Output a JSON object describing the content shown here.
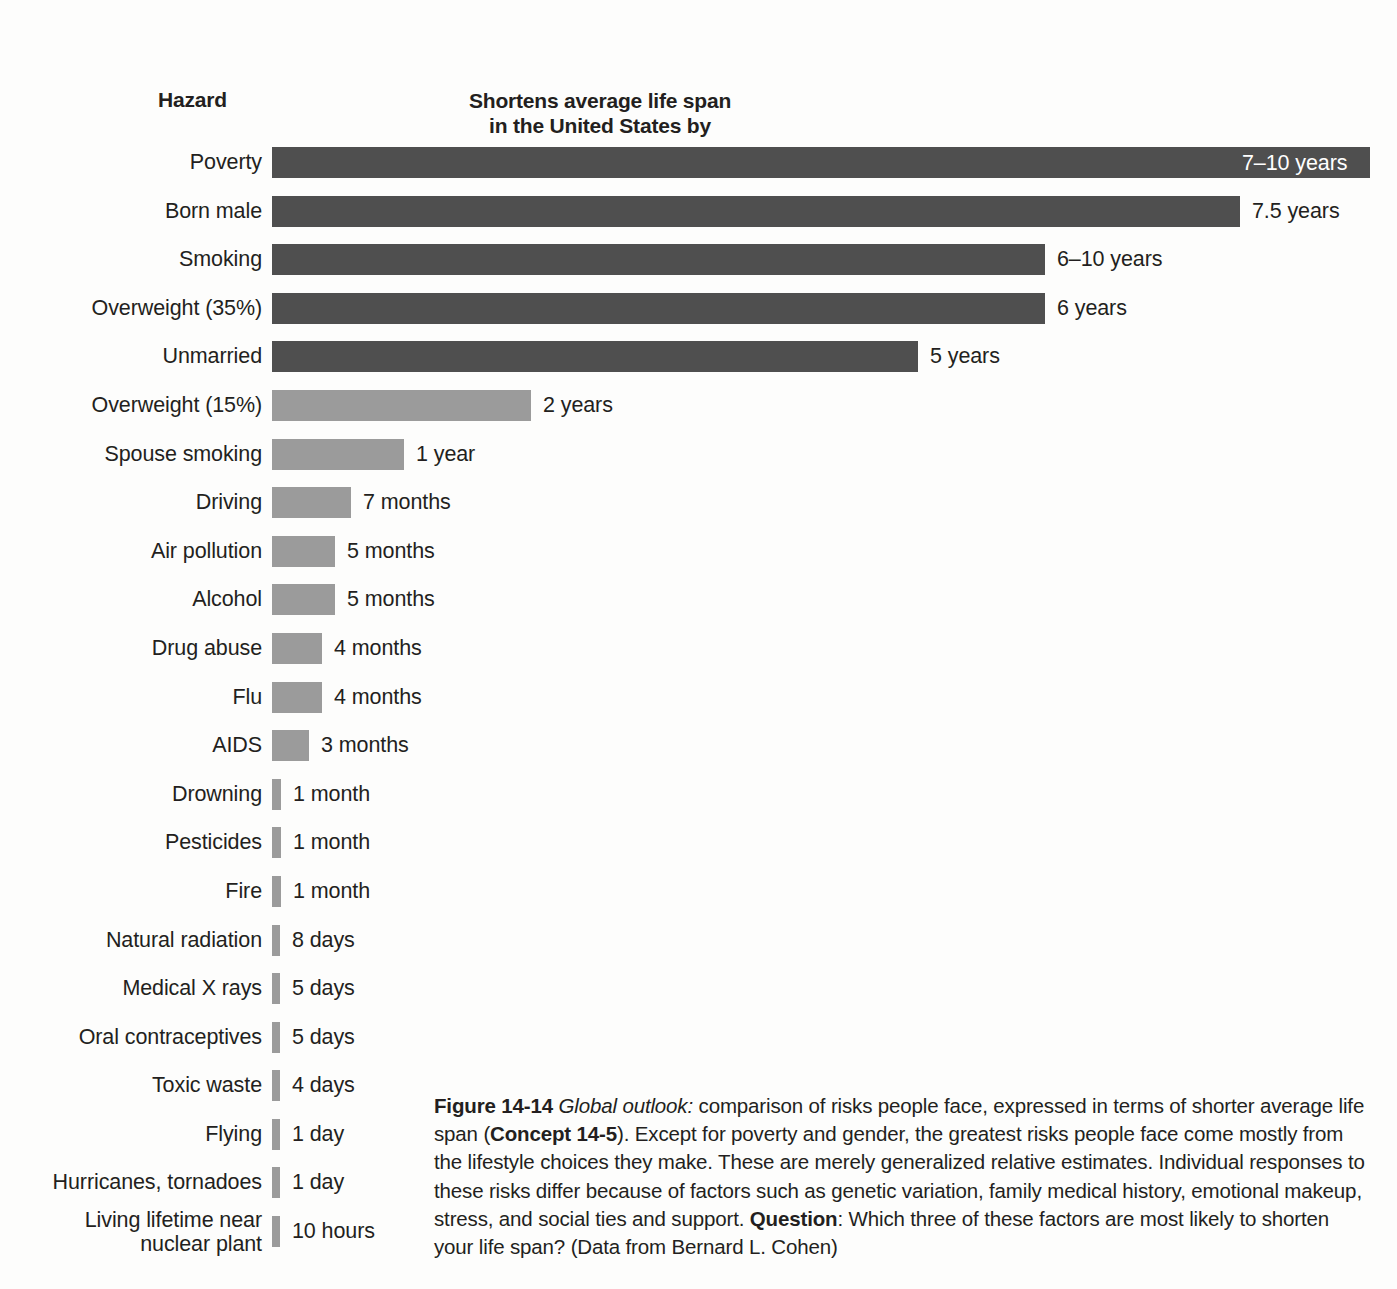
{
  "header": {
    "hazard_label": "Hazard",
    "value_label": "Shortens average life span\nin the United States by",
    "value_label_line1": "Shortens average life span",
    "value_label_line2": "in the United States by"
  },
  "colors": {
    "bar_dark": "#4f4f4f",
    "bar_light": "#9b9b9b",
    "text": "#231f20",
    "background": "#fdfdfc",
    "inside_label_text": "#ffffff"
  },
  "caption": {
    "figure_number": "Figure 14-14",
    "lead_italic": "Global outlook:",
    "text_part1": " comparison of risks people face, expressed in terms of shorter average life span (",
    "concept": "Concept 14-5",
    "text_part2": "). Except for poverty and gender, the greatest risks people face come mostly from the lifestyle choices they make. These are merely generalized relative estimates. Individual responses to these risks differ because of factors such as genetic variation, family medical history, emotional makeup, stress, and social ties and support. ",
    "question_label": "Question",
    "text_part3": ": Which three of these factors are most likely to shorten your life span? (Data from Bernard L. Cohen)"
  },
  "chart_data": {
    "type": "bar",
    "orientation": "horizontal",
    "title": "Shortens average life span in the United States by",
    "xlabel": "",
    "ylabel": "Hazard",
    "grid": false,
    "legend": "none",
    "axis_labels_shown": false,
    "categories": [
      "Poverty",
      "Born male",
      "Smoking",
      "Overweight (35%)",
      "Unmarried",
      "Overweight (15%)",
      "Spouse smoking",
      "Driving",
      "Air pollution",
      "Alcohol",
      "Drug abuse",
      "Flu",
      "AIDS",
      "Drowning",
      "Pesticides",
      "Fire",
      "Natural radiation",
      "Medical X rays",
      "Oral contraceptives",
      "Toxic waste",
      "Flying",
      "Hurricanes, tornadoes",
      "Living lifetime near nuclear plant"
    ],
    "value_labels": [
      "7–10 years",
      "7.5 years",
      "6–10 years",
      "6 years",
      "5 years",
      "2 years",
      "1 year",
      "7 months",
      "5 months",
      "5 months",
      "4 months",
      "4 months",
      "3 months",
      "1 month",
      "1 month",
      "1 month",
      "8 days",
      "5 days",
      "5 days",
      "4 days",
      "1 day",
      "1 day",
      "10 hours"
    ],
    "values_years": [
      8.5,
      7.5,
      8.0,
      6.0,
      5.0,
      2.0,
      1.0,
      0.583,
      0.417,
      0.417,
      0.333,
      0.333,
      0.25,
      0.083,
      0.083,
      0.083,
      0.0219,
      0.0137,
      0.0137,
      0.011,
      0.0027,
      0.0027,
      0.00114
    ],
    "rows": [
      {
        "hazard": "Poverty",
        "label": "7–10 years",
        "bar_px": 1098,
        "shade": "dark",
        "label_inside": true,
        "lines": 1
      },
      {
        "hazard": "Born male",
        "label": "7.5 years",
        "bar_px": 968,
        "shade": "dark",
        "label_inside": false,
        "lines": 1
      },
      {
        "hazard": "Smoking",
        "label": "6–10 years",
        "bar_px": 773,
        "shade": "dark",
        "label_inside": false,
        "lines": 1
      },
      {
        "hazard": "Overweight (35%)",
        "label": "6 years",
        "bar_px": 773,
        "shade": "dark",
        "label_inside": false,
        "lines": 1
      },
      {
        "hazard": "Unmarried",
        "label": "5 years",
        "bar_px": 646,
        "shade": "dark",
        "label_inside": false,
        "lines": 1
      },
      {
        "hazard": "Overweight (15%)",
        "label": "2 years",
        "bar_px": 259,
        "shade": "light",
        "label_inside": false,
        "lines": 1
      },
      {
        "hazard": "Spouse smoking",
        "label": "1 year",
        "bar_px": 132,
        "shade": "light",
        "label_inside": false,
        "lines": 1
      },
      {
        "hazard": "Driving",
        "label": "7 months",
        "bar_px": 79,
        "shade": "light",
        "label_inside": false,
        "lines": 1
      },
      {
        "hazard": "Air pollution",
        "label": "5 months",
        "bar_px": 63,
        "shade": "light",
        "label_inside": false,
        "lines": 1
      },
      {
        "hazard": "Alcohol",
        "label": "5 months",
        "bar_px": 63,
        "shade": "light",
        "label_inside": false,
        "lines": 1
      },
      {
        "hazard": "Drug abuse",
        "label": "4 months",
        "bar_px": 50,
        "shade": "light",
        "label_inside": false,
        "lines": 1
      },
      {
        "hazard": "Flu",
        "label": "4 months",
        "bar_px": 50,
        "shade": "light",
        "label_inside": false,
        "lines": 1
      },
      {
        "hazard": "AIDS",
        "label": "3 months",
        "bar_px": 37,
        "shade": "light",
        "label_inside": false,
        "lines": 1
      },
      {
        "hazard": "Drowning",
        "label": "1 month",
        "bar_px": 9,
        "shade": "light",
        "label_inside": false,
        "lines": 1
      },
      {
        "hazard": "Pesticides",
        "label": "1 month",
        "bar_px": 9,
        "shade": "light",
        "label_inside": false,
        "lines": 1
      },
      {
        "hazard": "Fire",
        "label": "1 month",
        "bar_px": 9,
        "shade": "light",
        "label_inside": false,
        "lines": 1
      },
      {
        "hazard": "Natural radiation",
        "label": "8 days",
        "bar_px": 8,
        "shade": "light",
        "label_inside": false,
        "lines": 1
      },
      {
        "hazard": "Medical X rays",
        "label": "5 days",
        "bar_px": 8,
        "shade": "light",
        "label_inside": false,
        "lines": 1
      },
      {
        "hazard": "Oral contraceptives",
        "label": "5 days",
        "bar_px": 8,
        "shade": "light",
        "label_inside": false,
        "lines": 1
      },
      {
        "hazard": "Toxic waste",
        "label": "4 days",
        "bar_px": 8,
        "shade": "light",
        "label_inside": false,
        "lines": 1
      },
      {
        "hazard": "Flying",
        "label": "1 day",
        "bar_px": 8,
        "shade": "light",
        "label_inside": false,
        "lines": 1
      },
      {
        "hazard": "Hurricanes, tornadoes",
        "label": "1 day",
        "bar_px": 8,
        "shade": "light",
        "label_inside": false,
        "lines": 1
      },
      {
        "hazard": "Living lifetime near\nnuclear plant",
        "label": "10 hours",
        "bar_px": 8,
        "shade": "light",
        "label_inside": false,
        "lines": 2
      }
    ]
  }
}
